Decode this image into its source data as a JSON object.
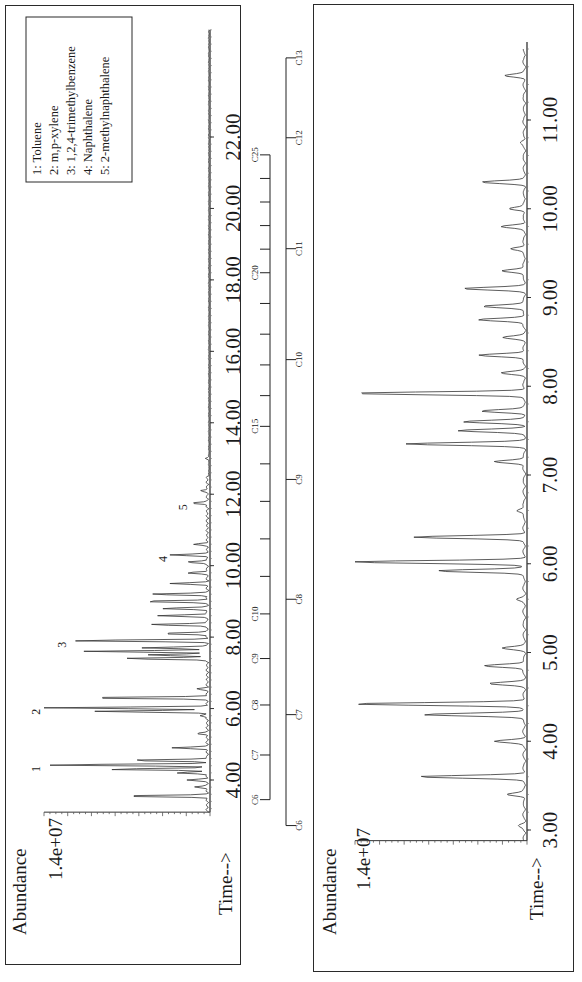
{
  "chart_data": [
    {
      "type": "line",
      "title": "",
      "panel": "left (full run, rotated 90° CCW)",
      "xlabel": "Time-->",
      "ylabel": "Abundance",
      "y_max_label": "1.4e+07",
      "xlim": [
        3.0,
        25.0
      ],
      "x_ticks": [
        "4.00",
        "6.00",
        "8.00",
        "10.00",
        "12.00",
        "14.00",
        "16.00",
        "18.00",
        "20.00",
        "22.00"
      ],
      "legend": [
        {
          "id": "1",
          "label": "Toluene"
        },
        {
          "id": "2",
          "label": "m,p-xylene"
        },
        {
          "id": "3",
          "label": "1,2,4-trimethylbenzene"
        },
        {
          "id": "4",
          "label": "Naphthalene"
        },
        {
          "id": "5",
          "label": "2-methylnaphthalene"
        }
      ],
      "peak_labels": [
        {
          "id": "1",
          "time": 4.42,
          "rel_abundance": 0.99
        },
        {
          "id": "2",
          "time": 6.02,
          "rel_abundance": 0.99
        },
        {
          "id": "3",
          "time": 7.9,
          "rel_abundance": 0.83
        },
        {
          "id": "4",
          "time": 10.3,
          "rel_abundance": 0.22
        },
        {
          "id": "5",
          "time": 11.75,
          "rel_abundance": 0.1
        }
      ],
      "peaks": {
        "time": [
          3.55,
          3.8,
          4.0,
          4.2,
          4.3,
          4.42,
          4.55,
          4.9,
          5.3,
          5.8,
          5.92,
          6.02,
          6.3,
          6.55,
          7.4,
          7.5,
          7.6,
          7.7,
          7.9,
          8.1,
          8.35,
          8.6,
          8.8,
          9.0,
          9.2,
          9.5,
          9.8,
          10.1,
          10.3,
          10.6,
          11.75,
          12.1,
          13.0
        ],
        "rel_abundance": [
          0.53,
          0.08,
          0.12,
          0.19,
          0.62,
          0.99,
          0.48,
          0.21,
          0.06,
          0.05,
          0.69,
          0.99,
          0.76,
          0.06,
          0.52,
          0.36,
          0.74,
          0.4,
          0.83,
          0.29,
          0.36,
          0.3,
          0.28,
          0.4,
          0.35,
          0.22,
          0.12,
          0.13,
          0.22,
          0.08,
          0.1,
          0.04,
          0.02
        ]
      },
      "carbon_scale": {
        "labels": [
          "C6",
          "C7",
          "C8",
          "C9",
          "C10",
          "C15",
          "C20",
          "C25"
        ],
        "positions_time": [
          3.45,
          4.7,
          6.1,
          7.4,
          8.65,
          13.9,
          18.2,
          21.5
        ]
      }
    },
    {
      "type": "line",
      "title": "",
      "panel": "right (expanded 3–11.8 min, rotated 90° CCW)",
      "xlabel": "Time-->",
      "ylabel": "Abundance",
      "y_max_label": "1.4e+07",
      "xlim": [
        2.9,
        11.8
      ],
      "x_ticks": [
        "3.00",
        "4.00",
        "5.00",
        "6.00",
        "7.00",
        "8.00",
        "9.00",
        "10.00",
        "11.00"
      ],
      "peaks": {
        "time": [
          3.05,
          3.4,
          3.6,
          4.0,
          4.3,
          4.42,
          4.65,
          4.85,
          5.05,
          5.6,
          5.92,
          6.02,
          6.3,
          6.6,
          7.15,
          7.35,
          7.5,
          7.6,
          7.72,
          7.92,
          8.15,
          8.35,
          8.55,
          8.75,
          8.9,
          9.1,
          9.3,
          9.55,
          9.8,
          10.0,
          10.3,
          10.75,
          11.5
        ],
        "rel_abundance": [
          0.03,
          0.1,
          0.61,
          0.17,
          0.59,
          0.99,
          0.2,
          0.24,
          0.12,
          0.04,
          0.51,
          0.99,
          0.64,
          0.05,
          0.18,
          0.68,
          0.38,
          0.35,
          0.25,
          0.99,
          0.13,
          0.27,
          0.12,
          0.27,
          0.25,
          0.35,
          0.14,
          0.08,
          0.13,
          0.09,
          0.24,
          0.02,
          0.11
        ]
      },
      "carbon_scale": {
        "labels": [
          "C6",
          "C7",
          "C8",
          "C9",
          "C10",
          "C11",
          "C12",
          "C13"
        ],
        "positions_time": [
          3.05,
          4.3,
          5.6,
          6.95,
          8.3,
          9.55,
          10.8,
          11.7
        ]
      }
    }
  ],
  "left_panel": {
    "abundance_label": "Abundance",
    "y_max": "1.4e+07",
    "time_label": "Time-->",
    "legend": [
      "1:  Toluene",
      "2:  m,p-xylene",
      "3:  1,2,4-trimethylbenzene",
      "4:  Naphthalene",
      "5:  2-methylnaphthalene"
    ]
  },
  "right_panel": {
    "abundance_label": "Abundance",
    "y_max": "1.4e+07",
    "time_label": "Time-->"
  }
}
